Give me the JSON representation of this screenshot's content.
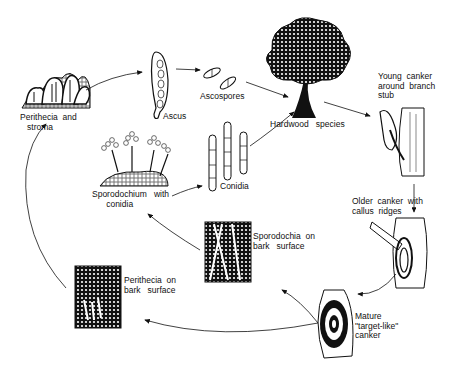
{
  "diagram": {
    "type": "disease-cycle",
    "nodes": [
      {
        "id": "perithecia-stroma",
        "label": "Perithecia  and\n   stroma"
      },
      {
        "id": "ascus",
        "label": "Ascus"
      },
      {
        "id": "ascospores",
        "label": "Ascospores"
      },
      {
        "id": "hardwood",
        "label": "Hardwood   species"
      },
      {
        "id": "young-canker",
        "label": "Young  canker\naround  branch\nstub"
      },
      {
        "id": "sporodochium",
        "label": "Sporodochium   with\n      conidia"
      },
      {
        "id": "conidia",
        "label": "Conidia"
      },
      {
        "id": "older-canker",
        "label": "Older  canker  with\ncallus  ridges"
      },
      {
        "id": "sporodochia-bark",
        "label": "Sporodochia  on\nbark   surface"
      },
      {
        "id": "perithecia-bark",
        "label": "Perithecia  on\nbark   surface"
      },
      {
        "id": "mature-canker",
        "label": "Mature\n\"target-like\"\ncanker"
      }
    ],
    "edges": [
      [
        "perithecia-stroma",
        "ascus"
      ],
      [
        "ascus",
        "ascospores"
      ],
      [
        "ascospores",
        "hardwood"
      ],
      [
        "sporodochium",
        "conidia"
      ],
      [
        "conidia",
        "hardwood"
      ],
      [
        "hardwood",
        "young-canker"
      ],
      [
        "young-canker",
        "older-canker"
      ],
      [
        "older-canker",
        "mature-canker"
      ],
      [
        "mature-canker",
        "sporodochia-bark"
      ],
      [
        "mature-canker",
        "perithecia-bark"
      ],
      [
        "sporodochia-bark",
        "sporodochium"
      ],
      [
        "perithecia-bark",
        "perithecia-stroma"
      ]
    ]
  },
  "colors": {
    "ink": "#111111",
    "background": "#ffffff"
  }
}
